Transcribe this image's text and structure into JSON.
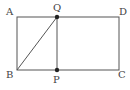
{
  "diagram": {
    "type": "geometry",
    "stroke_color": "#555555",
    "point_color": "#222222",
    "points": {
      "A": {
        "label": "A",
        "x": 17,
        "y": 17
      },
      "Q": {
        "label": "Q",
        "x": 57,
        "y": 17
      },
      "D": {
        "label": "D",
        "x": 119,
        "y": 17
      },
      "B": {
        "label": "B",
        "x": 17,
        "y": 70
      },
      "P": {
        "label": "P",
        "x": 57,
        "y": 70
      },
      "C": {
        "label": "C",
        "x": 119,
        "y": 70
      }
    },
    "segments": [
      "AD",
      "DC",
      "CB",
      "BA",
      "QP",
      "BQ"
    ],
    "marked_points": [
      "Q",
      "P"
    ]
  }
}
